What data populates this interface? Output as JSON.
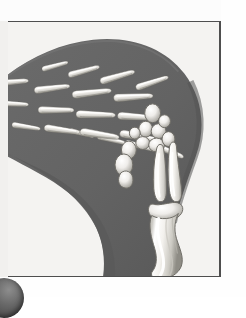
{
  "figure": {
    "caption": "",
    "style": "grayscale anatomical illustration",
    "view": "dorsal oblique",
    "orientation": "fingers to upper-left, forearm to lower-right"
  },
  "colors": {
    "page_background": "#ffffff",
    "plate_background": "#f4f3f1",
    "plate_border": "#4e4e4e",
    "limb_silhouette": "#636363",
    "limb_silhouette_shadow": "#555555",
    "bone_fill": "#f2f0ec",
    "bone_highlight": "#ffffff",
    "bone_shadow": "#8d8d8d",
    "bone_outline": "#6d6d6d",
    "corner_disc": "#3b3b3b"
  },
  "plate": {
    "left": 8,
    "top": 21,
    "width": 213,
    "height": 256
  },
  "anatomy": {
    "regions": [
      {
        "name": "phalanges",
        "label": "Finger bones (phalanges)",
        "count": 14
      },
      {
        "name": "metacarpals",
        "label": "Palm bones (metacarpals)",
        "count": 5
      },
      {
        "name": "carpals",
        "label": "Wrist bones (carpals)",
        "count": 8
      },
      {
        "name": "radius",
        "label": "Radius",
        "count": 1
      },
      {
        "name": "ulna",
        "label": "Ulna",
        "count": 1
      },
      {
        "name": "humerus",
        "label": "Humerus",
        "count": 1
      }
    ],
    "silhouette_description": "Dark gray limb soft-tissue outline curving from the upper-left across the top and down the right side, tapering toward the lower-right where the forearm and upper-arm bones lie."
  },
  "corner_element": {
    "name": "dark-disc",
    "description": "Partially visible dark sphere at the lower-left corner of the page"
  }
}
